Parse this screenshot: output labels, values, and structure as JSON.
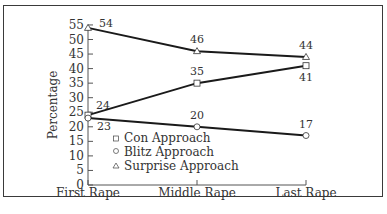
{
  "chart_data": {
    "type": "line",
    "title": "",
    "xlabel": "",
    "ylabel": "Percentage",
    "categories": [
      "First Rape",
      "Middle Rape",
      "Last Rape"
    ],
    "ylim": [
      0,
      55
    ],
    "yticks": [
      0,
      5,
      10,
      15,
      20,
      25,
      30,
      35,
      40,
      45,
      50,
      55
    ],
    "grid": false,
    "legend_position": "inside lower left",
    "series": [
      {
        "name": "Con Approach",
        "marker": "square",
        "values": [
          24,
          35,
          41
        ]
      },
      {
        "name": "Blitz Approach",
        "marker": "circle",
        "values": [
          23,
          20,
          17
        ]
      },
      {
        "name": "Surprise Approach",
        "marker": "triangle",
        "values": [
          54,
          46,
          44
        ]
      }
    ]
  },
  "colors": {
    "line": "#1a1a1a",
    "marker_fill": "#ffffff",
    "frame": "#3a3a3a",
    "text": "#333333"
  }
}
